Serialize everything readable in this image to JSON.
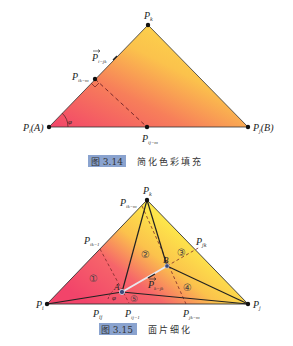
{
  "figure1": {
    "caption_number": "图 3.14",
    "caption_text": "简化色彩填充",
    "labels": {
      "pk": "P",
      "pk_sub": "k",
      "pa": "P",
      "pa_sub": "i",
      "pa_suffix": "(A)",
      "pb": "P",
      "pb_sub": "j",
      "pb_suffix": "(B)",
      "pikm": "P",
      "pikm_sub": "ik−m",
      "pijm": "P",
      "pijm_sub": "ij−m",
      "vec": "P",
      "vec_sub": "i−jk",
      "angle": "φ"
    },
    "colors": {
      "red": "#f2446a",
      "yellow": "#fde64a",
      "orange": "#f9a24a"
    }
  },
  "figure2": {
    "caption_number": "图 3.15",
    "caption_text": "面片细化",
    "labels": {
      "pk": "P",
      "pk_sub": "k",
      "pi": "P",
      "pi_sub": "i",
      "pj": "P",
      "pj_sub": "j",
      "pikm": "P",
      "pikm_sub": "ik−m",
      "pik1": "P",
      "pik1_sub": "ik−1",
      "pjk": "P",
      "pjk_sub": "jk",
      "pij": "P",
      "pij_sub": "ij",
      "pij1": "P",
      "pij1_sub": "ij−1",
      "pjkm": "P",
      "pjkm_sub": "jk−m",
      "a": "A",
      "b": "B",
      "vec": "P",
      "vec_sub": "k−jk",
      "angle": "φ"
    },
    "regions": [
      "①",
      "②",
      "③",
      "④",
      "⑤"
    ]
  }
}
